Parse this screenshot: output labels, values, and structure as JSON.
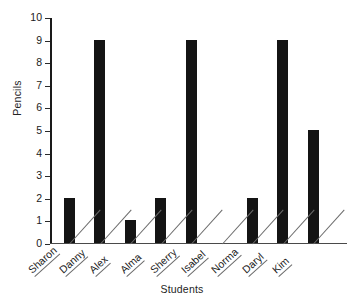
{
  "chart_data": {
    "type": "bar",
    "title": "",
    "xlabel": "Students",
    "ylabel": "Pencils",
    "categories": [
      "Sharon",
      "Danny",
      "Alex",
      "Alma",
      "Sherry",
      "Isabel",
      "Norma",
      "Daryl",
      "Kim"
    ],
    "values": [
      2,
      9,
      1,
      2,
      9,
      0,
      2,
      9,
      5
    ],
    "ylim": [
      0,
      10
    ],
    "ytick_labels": [
      "0",
      "1",
      "2",
      "3",
      "4",
      "5",
      "6",
      "7",
      "8",
      "9",
      "10"
    ],
    "ytick_values": [
      0,
      1,
      2,
      3,
      4,
      5,
      6,
      7,
      8,
      9,
      10
    ],
    "grid": false,
    "legend": false,
    "bar_color": "#141414",
    "axis_color": "#1a1a1a"
  }
}
